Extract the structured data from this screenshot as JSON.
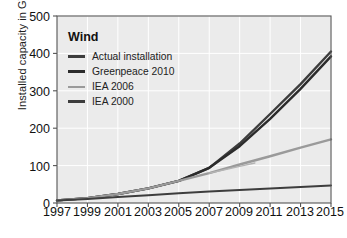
{
  "chart_data": {
    "type": "line",
    "title": "",
    "xlabel": "",
    "ylabel": "Installed capacity in GW",
    "xlim": [
      1997,
      2015
    ],
    "ylim": [
      0,
      500
    ],
    "yticks": [
      0,
      100,
      200,
      300,
      400,
      500
    ],
    "xticks": [
      1997,
      1999,
      2001,
      2003,
      2005,
      2007,
      2009,
      2011,
      2013,
      2015
    ],
    "grid": true,
    "legend_position": "top-left",
    "legend_title": "Wind",
    "series": [
      {
        "name": "Actual installation",
        "color": "#3d3d3d",
        "width": 2.4,
        "x": [
          1997,
          1999,
          2001,
          2003,
          2005,
          2007,
          2009,
          2011,
          2013,
          2015
        ],
        "values": [
          7,
          13,
          24,
          39,
          59,
          94,
          159,
          238,
          318,
          405
        ]
      },
      {
        "name": "Greenpeace 2010",
        "color": "#2b2b2b",
        "width": 2.4,
        "x": [
          1997,
          1999,
          2001,
          2003,
          2005,
          2007,
          2009,
          2011,
          2013,
          2015
        ],
        "values": [
          7,
          13,
          24,
          39,
          59,
          94,
          152,
          225,
          305,
          392
        ]
      },
      {
        "name": "IEA 2006",
        "color": "#9a9a9a",
        "width": 2.4,
        "x": [
          1997,
          1999,
          2001,
          2003,
          2005,
          2007,
          2009,
          2011,
          2013,
          2015
        ],
        "values": [
          7,
          13,
          24,
          39,
          59,
          80,
          103,
          125,
          148,
          170
        ]
      },
      {
        "name": "IEA 2000",
        "color": "#3d3d3d",
        "width": 2.0,
        "x": [
          1997,
          1999,
          2001,
          2003,
          2005,
          2007,
          2009,
          2011,
          2013,
          2015
        ],
        "values": [
          7,
          11,
          16,
          21,
          26,
          31,
          35,
          39,
          43,
          47
        ]
      },
      {
        "name": "IEA 2006 short branch",
        "color": "#b4b4b4",
        "width": 1.4,
        "x": [
          2007,
          2008,
          2009,
          2010
        ],
        "values": [
          80,
          89,
          98,
          107
        ]
      }
    ],
    "colors": {
      "plot_background": "#ebebeb",
      "gridline": "#ffffff",
      "axis": "#555555",
      "page_background": "#ffffff"
    }
  },
  "legend": {
    "title": "Wind",
    "items": [
      {
        "label": "Actual installation"
      },
      {
        "label": "Greenpeace 2010"
      },
      {
        "label": "IEA 2006"
      },
      {
        "label": "IEA 2000"
      }
    ]
  },
  "axes": {
    "y_title": "Installed capacity in GW",
    "y_ticks": [
      "500",
      "400",
      "300",
      "200",
      "100",
      "0"
    ],
    "x_ticks": [
      "1997",
      "1999",
      "2001",
      "2003",
      "2005",
      "2007",
      "2009",
      "2011",
      "2013",
      "2015"
    ]
  }
}
